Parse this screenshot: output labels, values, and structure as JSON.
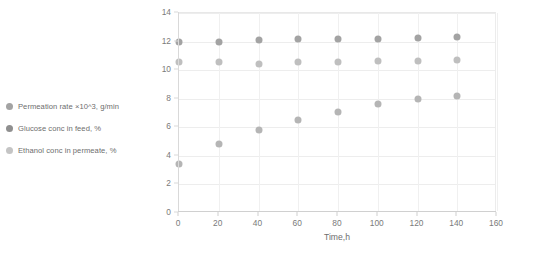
{
  "chart_data": {
    "type": "scatter",
    "title": "",
    "xlabel": "Time,h",
    "ylabel": "",
    "xlim": [
      0,
      160
    ],
    "ylim": [
      0,
      14
    ],
    "xticks": [
      0,
      20,
      40,
      60,
      80,
      100,
      120,
      140,
      160
    ],
    "yticks": [
      0,
      2,
      4,
      6,
      8,
      10,
      12,
      14
    ],
    "grid": true,
    "legend_position": "left",
    "x": [
      0,
      20,
      40,
      60,
      80,
      100,
      120,
      140
    ],
    "series": [
      {
        "name": "Permeation rate ×10^3, g/min",
        "color": "#a3a3a3",
        "values": [
          12.0,
          12.0,
          12.1,
          12.15,
          12.2,
          12.2,
          12.25,
          12.3
        ]
      },
      {
        "name": "Glucose conc in feed, %",
        "color": "#bfbfbf",
        "values": [
          10.6,
          10.55,
          10.4,
          10.6,
          10.6,
          10.65,
          10.65,
          10.7
        ]
      },
      {
        "name": "Ethanol conc in permeate, %",
        "color": "#b5b5b5",
        "values": [
          3.4,
          4.8,
          5.8,
          6.5,
          7.1,
          7.6,
          8.0,
          8.2
        ]
      }
    ]
  },
  "legend": {
    "items": [
      {
        "label": "Permeation rate ×10^3, g/min",
        "color": "#a3a3a3"
      },
      {
        "label": "Glucose conc in feed, %",
        "color": "#8f8f8f"
      },
      {
        "label": "Ethanol conc in permeate, %",
        "color": "#c4c4c4"
      }
    ]
  },
  "colors": {
    "grid": "#ededed",
    "axis": "#d9d9d9",
    "tick_text": "#7a7a7a",
    "legend_text": "#6d6d6d"
  }
}
